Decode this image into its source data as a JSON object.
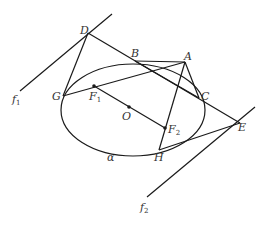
{
  "diagram": {
    "type": "conic-geometry",
    "colors": {
      "stroke": "#1a1a1a",
      "label": "#333333",
      "background": "#ffffff"
    },
    "ellipse": {
      "name": "α",
      "cx": 133,
      "cy": 110,
      "rx": 72,
      "ry": 46,
      "rotation": 0
    },
    "points": {
      "D": {
        "label": "D",
        "x": 88,
        "y": 33
      },
      "B": {
        "label": "B",
        "x": 135,
        "y": 61
      },
      "A": {
        "label": "A",
        "x": 185,
        "y": 62
      },
      "C": {
        "label": "C",
        "x": 199,
        "y": 98
      },
      "G": {
        "label": "G",
        "x": 63,
        "y": 96
      },
      "F1": {
        "label": "F",
        "sub": "1",
        "x": 94,
        "y": 86
      },
      "O": {
        "label": "O",
        "x": 129,
        "y": 107
      },
      "F2": {
        "label": "F",
        "sub": "2",
        "x": 165,
        "y": 128
      },
      "H": {
        "label": "H",
        "x": 159,
        "y": 150
      },
      "E": {
        "label": "E",
        "x": 240,
        "y": 123
      }
    },
    "lines": {
      "f1": {
        "label": "f",
        "sub": "1",
        "x1": 112,
        "y1": 14,
        "x2": 20,
        "y2": 91
      },
      "f2": {
        "label": "f",
        "sub": "2",
        "x1": 255,
        "y1": 107,
        "x2": 147,
        "y2": 197
      }
    },
    "labels": {
      "alpha": "α",
      "D": "D",
      "B": "B",
      "A": "A",
      "C": "C",
      "G": "G",
      "F": "F",
      "sub1": "1",
      "sub2": "2",
      "O": "O",
      "H": "H",
      "E": "E",
      "f": "f"
    }
  }
}
